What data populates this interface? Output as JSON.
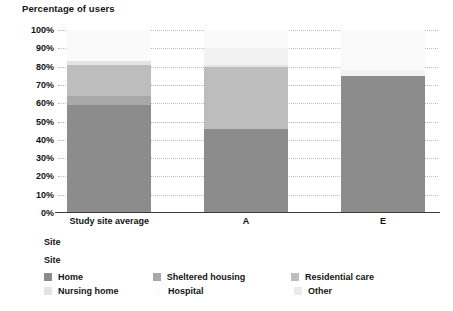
{
  "chart_data": {
    "type": "bar",
    "variant": "stacked-bar-100",
    "title": "Percentage of users",
    "xlabel": "Site",
    "ylabel": "",
    "categories": [
      "Study site average",
      "A",
      "E"
    ],
    "ylim": [
      0,
      100
    ],
    "ytick_labels": [
      "0%",
      "10%",
      "20%",
      "30%",
      "40%",
      "50%",
      "60%",
      "70%",
      "80%",
      "90%",
      "100%"
    ],
    "ytick_values": [
      0,
      10,
      20,
      30,
      40,
      50,
      60,
      70,
      80,
      90,
      100
    ],
    "grid": true,
    "legend_position": "bottom-left",
    "legend_title": "Site",
    "series": [
      {
        "name": "Home",
        "color": "#8c8c8c",
        "values": [
          59,
          46,
          75
        ]
      },
      {
        "name": "Sheltered housing",
        "color": "#a8a8a8",
        "values": [
          5,
          0,
          0
        ]
      },
      {
        "name": "Residential care",
        "color": "#bdbdbd",
        "values": [
          17,
          34,
          0
        ]
      },
      {
        "name": "Nursing home",
        "color": "#e3e3e3",
        "values": [
          2,
          1,
          0
        ]
      },
      {
        "name": "Hospital",
        "color": "#f2f2f2",
        "values": [
          0,
          9,
          3
        ]
      },
      {
        "name": "Other",
        "color": "#fafafa",
        "values": [
          17,
          10,
          22
        ]
      }
    ]
  },
  "legend": {
    "title": "Site",
    "rows": [
      [
        {
          "label": "Home",
          "color": "#8c8c8c",
          "visible_swatch": true
        },
        {
          "label": "Sheltered housing",
          "color": "#a8a8a8",
          "visible_swatch": true
        },
        {
          "label": "Residential care",
          "color": "#bdbdbd",
          "visible_swatch": true
        }
      ],
      [
        {
          "label": "Nursing home",
          "color": "#e3e3e3",
          "visible_swatch": true
        },
        {
          "label": "Hospital",
          "color": "#fcfcfc",
          "visible_swatch": false
        },
        {
          "label": "Other",
          "color": "#ebebeb",
          "visible_swatch": true
        }
      ]
    ]
  },
  "colors": {
    "axis": "#3b3b3b",
    "grid": "#b9b9b9",
    "text": "#111111",
    "background": "#ffffff"
  }
}
